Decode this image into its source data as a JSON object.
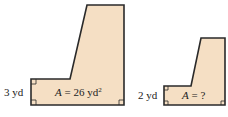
{
  "figures": [
    {
      "side_label": "3 yd",
      "area_var": "A",
      "area_eq": " = 26 yd",
      "area_sup": "2"
    },
    {
      "side_label": "2 yd",
      "area_var": "A",
      "area_eq": " = ?",
      "area_sup": ""
    }
  ],
  "colors": {
    "fill": "#f5dfc4",
    "stroke": "#2a2a2a"
  }
}
